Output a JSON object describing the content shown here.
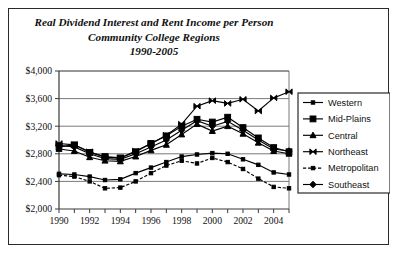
{
  "chart_data": {
    "type": "line",
    "title": "Real Dividend Interest and Rent Income per Person",
    "subtitle": "Community College Regions",
    "period": "1990-2005",
    "xlabel": "",
    "ylabel": "",
    "grid": true,
    "legend_position": "right",
    "xlim": [
      1990,
      2005
    ],
    "ylim": [
      2000,
      4000
    ],
    "ytick_step": 400,
    "x": [
      1990,
      1991,
      1992,
      1993,
      1994,
      1995,
      1996,
      1997,
      1998,
      1999,
      2000,
      2001,
      2002,
      2003,
      2004,
      2005
    ],
    "xtick_labels": [
      "1990",
      "1992",
      "1994",
      "1996",
      "1998",
      "2000",
      "2002",
      "2004"
    ],
    "xtick_values": [
      1990,
      1992,
      1994,
      1996,
      1998,
      2000,
      2002,
      2004
    ],
    "ytick_labels": [
      "$2,000",
      "$2,400",
      "$2,800",
      "$3,200",
      "$3,600",
      "$4,000"
    ],
    "ytick_values": [
      2000,
      2400,
      2800,
      3200,
      3600,
      4000
    ],
    "series": [
      {
        "name": "Western",
        "marker": "small-square",
        "values": [
          2510,
          2500,
          2470,
          2420,
          2430,
          2520,
          2600,
          2680,
          2760,
          2790,
          2810,
          2800,
          2720,
          2640,
          2530,
          2500
        ]
      },
      {
        "name": "Mid-Plains",
        "marker": "large-square",
        "values": [
          2900,
          2930,
          2820,
          2760,
          2740,
          2830,
          2950,
          3060,
          3200,
          3300,
          3260,
          3330,
          3180,
          3030,
          2890,
          2830
        ]
      },
      {
        "name": "Central",
        "marker": "triangle",
        "values": [
          2870,
          2840,
          2750,
          2700,
          2690,
          2760,
          2850,
          2930,
          3080,
          3230,
          3130,
          3200,
          3090,
          2960,
          2840,
          2800
        ]
      },
      {
        "name": "Northeast",
        "marker": "bowtie",
        "values": [
          2950,
          2930,
          2830,
          2750,
          2740,
          2840,
          2950,
          3070,
          3230,
          3490,
          3570,
          3530,
          3590,
          3420,
          3610,
          3700
        ]
      },
      {
        "name": "Metropolitan",
        "marker": "small-square-dotted",
        "values": [
          2490,
          2470,
          2400,
          2300,
          2310,
          2400,
          2520,
          2630,
          2700,
          2660,
          2740,
          2680,
          2580,
          2440,
          2320,
          2300
        ]
      },
      {
        "name": "Southeast",
        "marker": "diamond",
        "values": [
          2920,
          2900,
          2800,
          2730,
          2720,
          2800,
          2900,
          3000,
          3140,
          3280,
          3200,
          3270,
          3140,
          3000,
          2870,
          2840
        ]
      }
    ]
  }
}
